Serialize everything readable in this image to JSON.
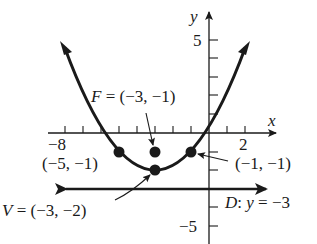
{
  "figure": {
    "type": "parabola-graph",
    "equation_form": "vertical parabola opening upward",
    "axes": {
      "x_label": "x",
      "y_label": "y",
      "x_tick_labels": [
        "-8",
        "2"
      ],
      "y_tick_labels": [
        "5",
        "-5"
      ],
      "x_range": [
        -9,
        3
      ],
      "y_range": [
        -6,
        6
      ]
    },
    "labels": {
      "focus": "F = (−3, −1)",
      "vertex": "V = (−3, −2)",
      "left_point": "(−5, −1)",
      "right_point": "(−1, −1)",
      "directrix": "D: y = −3",
      "x_tick_neg8": "−8",
      "x_tick_2": "2",
      "y_tick_5": "5",
      "y_tick_neg5": "−5",
      "x_axis": "x",
      "y_axis": "y"
    },
    "points": [
      {
        "name": "focus",
        "x": -3,
        "y": -1
      },
      {
        "name": "vertex",
        "x": -3,
        "y": -2
      },
      {
        "name": "latus-left",
        "x": -5,
        "y": -1
      },
      {
        "name": "latus-right",
        "x": -1,
        "y": -1
      }
    ],
    "directrix_y": -3,
    "colors": {
      "ink": "#1a1a1a",
      "background": "#ffffff"
    }
  }
}
